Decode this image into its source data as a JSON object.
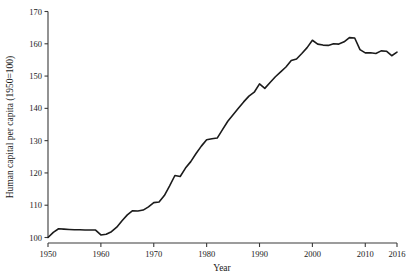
{
  "chart_data": {
    "type": "line",
    "title": "",
    "xlabel": "Year",
    "ylabel": "Human capital per capita (1950=100)",
    "xlim": [
      1950,
      2016
    ],
    "ylim": [
      100,
      170
    ],
    "grid": false,
    "legend": "none",
    "x_ticks": [
      1950,
      1960,
      1970,
      1980,
      1990,
      2000,
      2010,
      2016
    ],
    "y_ticks": [
      100,
      110,
      120,
      130,
      140,
      150,
      160,
      170
    ],
    "series": [
      {
        "name": "Human capital per capita",
        "x": [
          1950,
          1951,
          1952,
          1953,
          1954,
          1955,
          1956,
          1957,
          1958,
          1959,
          1960,
          1961,
          1962,
          1963,
          1964,
          1965,
          1966,
          1967,
          1968,
          1969,
          1970,
          1971,
          1972,
          1973,
          1974,
          1975,
          1976,
          1977,
          1978,
          1979,
          1980,
          1981,
          1982,
          1983,
          1984,
          1985,
          1986,
          1987,
          1988,
          1989,
          1990,
          1991,
          1992,
          1993,
          1994,
          1995,
          1996,
          1997,
          1998,
          1999,
          2000,
          2001,
          2002,
          2003,
          2004,
          2005,
          2006,
          2007,
          2008,
          2009,
          2010,
          2011,
          2012,
          2013,
          2014,
          2015,
          2016
        ],
        "y": [
          100.0,
          101.6,
          102.7,
          102.6,
          102.5,
          102.4,
          102.4,
          102.3,
          102.3,
          102.3,
          100.8,
          101.0,
          101.8,
          103.2,
          105.2,
          107.0,
          108.3,
          108.2,
          108.5,
          109.5,
          110.8,
          111.0,
          113.0,
          116.0,
          119.2,
          118.9,
          121.5,
          123.5,
          126.0,
          128.3,
          130.3,
          130.6,
          130.8,
          133.4,
          136.0,
          138.0,
          140.0,
          142.0,
          143.8,
          145.0,
          147.6,
          146.2,
          148.0,
          149.8,
          151.3,
          152.8,
          154.8,
          155.3,
          157.0,
          158.8,
          161.1,
          159.9,
          159.6,
          159.5,
          160.0,
          159.9,
          160.6,
          161.9,
          161.8,
          158.2,
          157.2,
          157.2,
          157.0,
          157.8,
          157.7,
          156.3,
          157.4
        ]
      }
    ]
  },
  "axes": {
    "x_tick_labels": [
      "1950",
      "1960",
      "1970",
      "1980",
      "1990",
      "2000",
      "2010",
      "2016"
    ],
    "y_tick_labels": [
      "100",
      "110",
      "120",
      "130",
      "140",
      "150",
      "160",
      "170"
    ],
    "x_axis_title": "Year",
    "y_axis_title": "Human capital per capita (1950=100)"
  },
  "colors": {
    "line": "#1b1b1b",
    "axis": "#3a3a3a",
    "background": "#ffffff",
    "text": "#1a1a1a"
  }
}
